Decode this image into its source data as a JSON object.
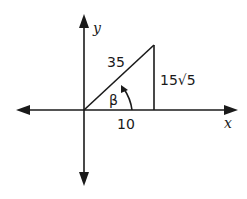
{
  "diagram": {
    "type": "right-triangle-on-axes",
    "axes": {
      "x_label": "x",
      "y_label": "y"
    },
    "triangle": {
      "hypotenuse_label": "35",
      "adjacent_label": "10",
      "opposite_label": "15√5",
      "angle_label": "β"
    },
    "colors": {
      "stroke": "#1a1a1a",
      "background": "#ffffff"
    }
  }
}
